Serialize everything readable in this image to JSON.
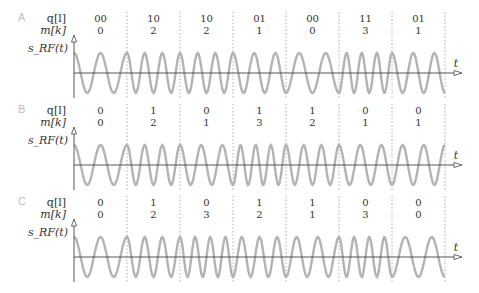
{
  "chart_data": {
    "type": "diagram",
    "title": "",
    "row_labels": {
      "q": "q[l]",
      "m": "m[k]",
      "signal": "s_RF(t)",
      "time": "t"
    },
    "panels": [
      {
        "letter": "A",
        "q": [
          "00",
          "10",
          "10",
          "01",
          "00",
          "11",
          "01"
        ],
        "m": [
          0,
          2,
          2,
          1,
          0,
          3,
          1
        ]
      },
      {
        "letter": "B",
        "q": [
          "0",
          "1",
          "0",
          "1",
          "1",
          "0",
          "0"
        ],
        "m": [
          0,
          2,
          1,
          3,
          2,
          1,
          1
        ]
      },
      {
        "letter": "C",
        "q": [
          "0",
          "1",
          "0",
          "1",
          "1",
          "0",
          "0"
        ],
        "m": [
          0,
          2,
          3,
          2,
          1,
          3,
          0
        ]
      }
    ],
    "colors": {
      "waveform": "#b3b3b3",
      "axis": "#444444",
      "divider": "#999999",
      "panel_letter": "#bdbdbd"
    }
  }
}
